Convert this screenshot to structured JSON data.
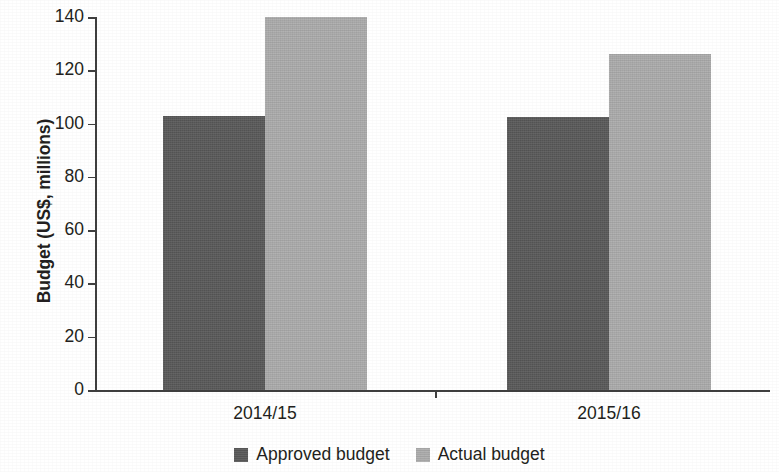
{
  "chart_data": {
    "type": "bar",
    "title": "",
    "xlabel": "",
    "ylabel": "Budget (US$, millions)",
    "categories": [
      "2014/15",
      "2015/16"
    ],
    "series": [
      {
        "name": "Approved budget",
        "color": "#5a5a5a",
        "values": [
          103,
          102.5
        ]
      },
      {
        "name": "Actual budget",
        "color": "#adadad",
        "values": [
          140,
          126
        ]
      }
    ],
    "ylim": [
      0,
      140
    ],
    "yticks": [
      0,
      20,
      40,
      60,
      80,
      100,
      120,
      140
    ],
    "ytick_labels": [
      "0",
      "20",
      "40",
      "60",
      "80",
      "100",
      "120",
      "140"
    ],
    "grid": false,
    "legend_position": "bottom-center",
    "axis_color": "#3f3f3f",
    "text_color": "#231f20",
    "background": "#ffffff"
  },
  "legend": {
    "entries": [
      {
        "label": "Approved budget",
        "swatch_name": "legend-swatch-approved-budget"
      },
      {
        "label": "Actual budget",
        "swatch_name": "legend-swatch-actual-budget"
      }
    ]
  }
}
